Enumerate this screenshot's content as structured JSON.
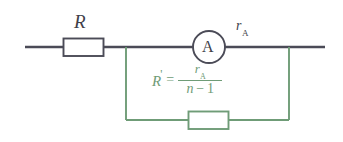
{
  "diagram": {
    "type": "circuit-schematic",
    "colors": {
      "main_circuit": "#4b4b57",
      "shunt_circuit": "#6f9c77",
      "background": "#ffffff"
    },
    "main_branch": {
      "resistor_label": "R",
      "ammeter_symbol": "A",
      "ammeter_resistance_label": {
        "symbol": "r",
        "subscript": "A"
      }
    },
    "shunt_branch": {
      "formula": {
        "lhs": "R",
        "lhs_prime": "'",
        "equals": "=",
        "numerator": {
          "symbol": "r",
          "subscript": "A"
        },
        "denominator": {
          "variable": "n",
          "minus": "−",
          "number": "1"
        },
        "plain_text": "R' = r_A / (n − 1)"
      }
    }
  }
}
